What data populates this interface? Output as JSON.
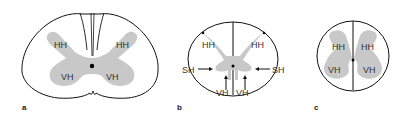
{
  "figure": {
    "panels": [
      {
        "id": "a",
        "label": "a",
        "regions": {
          "dorsal_left": "HH",
          "dorsal_right": "HH",
          "ventral_left": "VH",
          "ventral_right": "VH"
        }
      },
      {
        "id": "b",
        "label": "b",
        "regions": {
          "dorsal_left": "HH",
          "dorsal_right": "HH",
          "lateral_left": "SH",
          "lateral_right": "SH",
          "ventral_left": "VH",
          "ventral_right": "VH"
        }
      },
      {
        "id": "c",
        "label": "c",
        "regions": {
          "dorsal_left": "HH",
          "dorsal_right": "HH",
          "ventral_left": "VH",
          "ventral_right": "VH"
        }
      }
    ],
    "colors": {
      "outline": "#111111",
      "gray_matter": "#c8c8c8",
      "text": "#333333"
    }
  }
}
